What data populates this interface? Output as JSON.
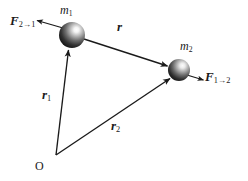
{
  "figure": {
    "type": "physics-vector-diagram",
    "canvas": {
      "width": 248,
      "height": 181
    },
    "background_color": "#ffffff",
    "line_color": "#1a1a1a",
    "text_color": "#1a1a1a",
    "sphere_dark_color": "#1c1c1c",
    "sphere_highlight_color": "#f2f2f2"
  },
  "bodies": [
    {
      "id": "mass-1",
      "label": "m",
      "subscript": "1",
      "center": {
        "x": 72,
        "y": 35
      },
      "radius": 13
    },
    {
      "id": "mass-2",
      "label": "m",
      "subscript": "2",
      "center": {
        "x": 179,
        "y": 70
      },
      "radius": 11
    }
  ],
  "origin": {
    "label": "O",
    "point": {
      "x": 56,
      "y": 155
    }
  },
  "vectors": [
    {
      "id": "force-2-on-1",
      "label": "F",
      "arrow_glyph": "→",
      "subscript_from": "2",
      "subscript_to": "1",
      "full_text": "F2→1",
      "description": "force exerted by mass 2 on mass 1",
      "from": {
        "x": 62,
        "y": 27
      },
      "to": {
        "x": 36,
        "y": 20
      },
      "arrowhead_at": "to"
    },
    {
      "id": "force-1-on-2",
      "label": "F",
      "arrow_glyph": "→",
      "subscript_from": "1",
      "subscript_to": "2",
      "full_text": "F1→2",
      "description": "force exerted by mass 1 on mass 2",
      "from": {
        "x": 188,
        "y": 75
      },
      "to": {
        "x": 204,
        "y": 80
      },
      "arrowhead_at": "to"
    },
    {
      "id": "separation-r",
      "label": "r",
      "subscript": "",
      "full_text": "r",
      "description": "separation vector from mass 1 to mass 2",
      "from": {
        "x": 85,
        "y": 39
      },
      "to": {
        "x": 168,
        "y": 66
      },
      "arrowhead_at": "to"
    },
    {
      "id": "position-r1",
      "label": "r",
      "subscript": "1",
      "full_text": "r1",
      "description": "position vector of mass 1 from origin O",
      "from": {
        "x": 56,
        "y": 155
      },
      "to": {
        "x": 68,
        "y": 49
      },
      "arrowhead_at": "to"
    },
    {
      "id": "position-r2",
      "label": "r",
      "subscript": "2",
      "full_text": "r2",
      "description": "position vector of mass 2 from origin O",
      "from": {
        "x": 56,
        "y": 155
      },
      "to": {
        "x": 170,
        "y": 78
      },
      "arrowhead_at": "to"
    }
  ],
  "labels": {
    "force_2_on_1": "F",
    "force_1_on_2": "F",
    "separation": "r",
    "position_1": "r",
    "position_2": "r",
    "mass_1": "m",
    "mass_2": "m",
    "origin": "O",
    "sub_1": "1",
    "sub_2": "2",
    "arrow": "→"
  }
}
